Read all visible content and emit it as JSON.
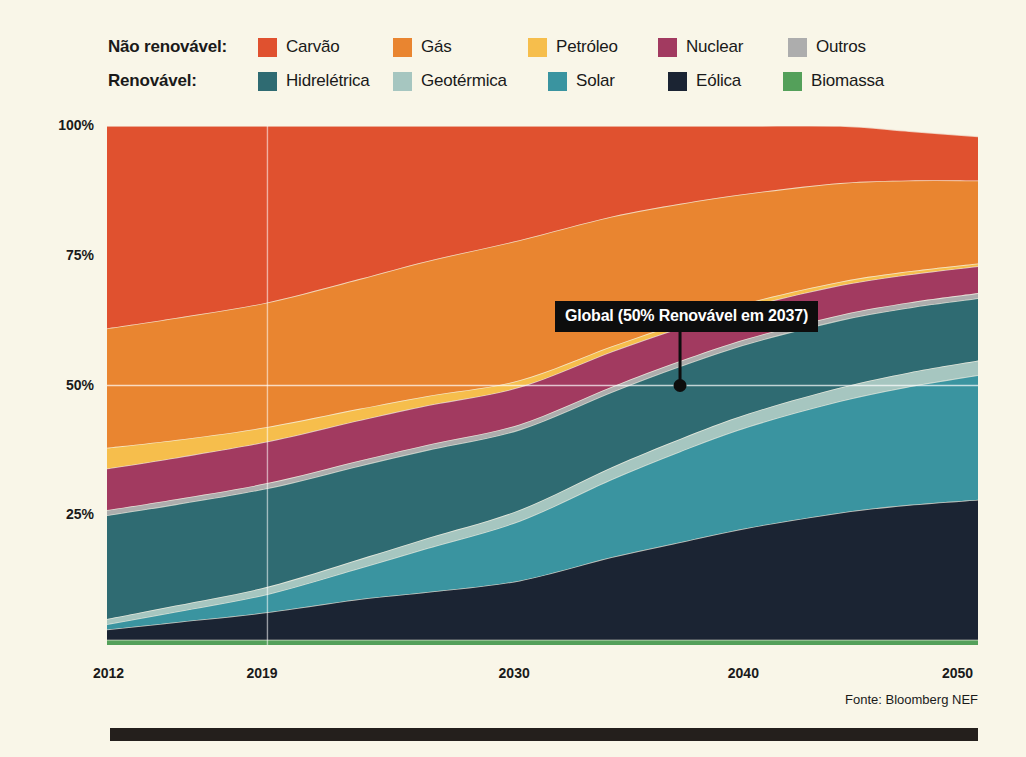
{
  "legend": {
    "rows": [
      {
        "group_label": "Não renovável:",
        "items": [
          {
            "label": "Carvão",
            "color": "#E0512F"
          },
          {
            "label": "Gás",
            "color": "#E98530"
          },
          {
            "label": "Petróleo",
            "color": "#F6BE4C"
          },
          {
            "label": "Nuclear",
            "color": "#A23A60"
          },
          {
            "label": "Outros",
            "color": "#ADADAD"
          }
        ]
      },
      {
        "group_label": "Renovável:",
        "items": [
          {
            "label": "Hidrelétrica",
            "color": "#2F6B72"
          },
          {
            "label": "Geotérmica",
            "color": "#A6C6C0"
          },
          {
            "label": "Solar",
            "color": "#3A94A0"
          },
          {
            "label": "Eólica",
            "color": "#1B2433"
          },
          {
            "label": "Biomassa",
            "color": "#54A05A"
          }
        ]
      }
    ]
  },
  "annotation": {
    "text": "Global (50% Renovável em 2037)",
    "year": 2037,
    "value": 50
  },
  "source": "Fonte: Bloomberg NEF",
  "chart_data": {
    "type": "area",
    "title": "",
    "xlabel": "",
    "ylabel": "",
    "stacked": true,
    "normalized": true,
    "grid": true,
    "legend_position": "top",
    "ylim": [
      0,
      100
    ],
    "xlim": [
      2012,
      2050
    ],
    "y_ticks": [
      "25%",
      "50%",
      "75%",
      "100%"
    ],
    "y_tick_values": [
      25,
      50,
      75,
      100
    ],
    "x_ticks": [
      "2012",
      "2019",
      "2030",
      "2040",
      "2050"
    ],
    "x_tick_values": [
      2012,
      2019,
      2030,
      2040,
      2050
    ],
    "x": [
      2012,
      2015,
      2019,
      2023,
      2026,
      2030,
      2034,
      2037,
      2040,
      2044,
      2047,
      2050
    ],
    "stack_order": [
      "Biomassa",
      "Eólica",
      "Solar",
      "Geotérmica",
      "Hidrelétrica",
      "Outros",
      "Nuclear",
      "Petróleo",
      "Gás",
      "Carvão"
    ],
    "series": [
      {
        "name": "Carvão",
        "color": "#E0512F",
        "values": [
          39.0,
          37.0,
          34.0,
          29.5,
          26.0,
          22.0,
          17.5,
          15.0,
          13.0,
          11.0,
          9.5,
          8.5
        ]
      },
      {
        "name": "Gás",
        "color": "#E98530",
        "values": [
          23.0,
          23.5,
          24.0,
          25.0,
          26.0,
          27.0,
          25.0,
          23.0,
          21.0,
          19.0,
          17.5,
          16.0
        ]
      },
      {
        "name": "Petróleo",
        "color": "#F6BE4C",
        "values": [
          4.0,
          3.4,
          2.8,
          2.2,
          1.8,
          1.3,
          1.0,
          0.9,
          0.8,
          0.7,
          0.6,
          0.5
        ]
      },
      {
        "name": "Nuclear",
        "color": "#A23A60",
        "values": [
          8.0,
          8.0,
          8.0,
          7.8,
          7.6,
          7.2,
          6.8,
          6.4,
          6.1,
          5.7,
          5.4,
          5.2
        ]
      },
      {
        "name": "Outros",
        "color": "#ADADAD",
        "values": [
          1.0,
          1.0,
          1.0,
          1.0,
          1.0,
          1.0,
          1.0,
          1.0,
          1.0,
          1.0,
          1.0,
          1.0
        ]
      },
      {
        "name": "Hidrelétrica",
        "color": "#2F6B72",
        "values": [
          20.0,
          19.5,
          19.0,
          18.0,
          17.0,
          15.5,
          14.5,
          14.0,
          13.5,
          13.0,
          12.5,
          12.0
        ]
      },
      {
        "name": "Geotérmica",
        "color": "#A6C6C0",
        "values": [
          1.0,
          1.2,
          1.4,
          1.7,
          1.9,
          2.1,
          2.3,
          2.4,
          2.5,
          2.6,
          2.7,
          2.8
        ]
      },
      {
        "name": "Solar",
        "color": "#3A94A0",
        "values": [
          1.0,
          2.0,
          3.5,
          6.0,
          8.5,
          11.5,
          15.0,
          17.5,
          19.5,
          21.5,
          22.8,
          24.0
        ]
      },
      {
        "name": "Eólica",
        "color": "#1B2433",
        "values": [
          2.0,
          3.4,
          5.3,
          7.8,
          9.2,
          11.4,
          15.9,
          18.8,
          21.6,
          24.5,
          26.0,
          27.0
        ]
      },
      {
        "name": "Biomassa",
        "color": "#54A05A",
        "values": [
          1.0,
          1.0,
          1.0,
          1.0,
          1.0,
          1.0,
          1.0,
          1.0,
          1.0,
          1.0,
          1.0,
          1.0
        ]
      }
    ]
  }
}
